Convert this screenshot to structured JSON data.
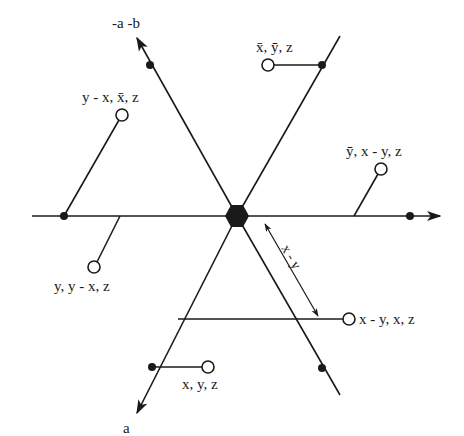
{
  "diagram": {
    "center": {
      "x": 237,
      "y": 216,
      "shape": "hexagon",
      "color": "#1a1a1a"
    },
    "axes": {
      "horizontal": {
        "x1": 32,
        "x2": 440,
        "y": 216,
        "arrow_end": "right"
      },
      "neg_a_b": {
        "label": "-a -b",
        "x1": 237,
        "y1": 216,
        "x2": 137,
        "y2": 38
      },
      "a": {
        "label": "a",
        "x1": 237,
        "y1": 216,
        "x2": 137,
        "y2": 413
      }
    },
    "lines": {
      "upper_right": {
        "x1": 237,
        "y1": 216,
        "x2": 340,
        "y2": 36
      },
      "lower_right": {
        "x1": 237,
        "y1": 216,
        "x2": 340,
        "y2": 395
      }
    },
    "sites": [
      {
        "label": "x̄, ȳ, z",
        "circle": [
          268,
          65
        ],
        "anchor": [
          322,
          65
        ],
        "label_pos": [
          256,
          52
        ]
      },
      {
        "label": "y - x, x̄, z",
        "circle": [
          122,
          115
        ],
        "anchor": [
          64,
          216
        ],
        "label_pos": [
          82,
          102
        ]
      },
      {
        "label": "ȳ, x - y, z",
        "circle": [
          381,
          169
        ],
        "anchor": [
          354,
          216
        ],
        "label_pos": [
          346,
          156
        ]
      },
      {
        "label": "y, y - x, z",
        "circle": [
          94,
          267
        ],
        "anchor": [
          120,
          216
        ],
        "label_pos": [
          54,
          291
        ]
      },
      {
        "label": "x - y, x, z",
        "circle": [
          349,
          319
        ],
        "anchor": [
          178,
          319
        ],
        "label_pos": [
          359,
          324
        ]
      },
      {
        "label": "x, y, z",
        "circle": [
          208,
          367
        ],
        "anchor": [
          152,
          367
        ],
        "label_pos": [
          182,
          389
        ]
      }
    ],
    "dots": [
      [
        64,
        216
      ],
      [
        410,
        216
      ],
      [
        150,
        65
      ],
      [
        322,
        65
      ],
      [
        152,
        367
      ],
      [
        322,
        368
      ]
    ],
    "dimension": {
      "label": "x - y",
      "x1": 265,
      "y1": 224,
      "x2": 318,
      "y2": 316
    }
  }
}
